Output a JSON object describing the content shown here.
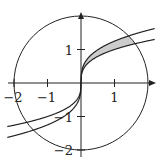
{
  "figure": {
    "colors": {
      "stroke": "#222222",
      "shade": "#cccccc",
      "background": "#ffffff"
    },
    "axes": {
      "x_ticks": [
        {
          "value": -2,
          "label": "−2"
        },
        {
          "value": -1,
          "label": "−1"
        },
        {
          "value": 1,
          "label": "1"
        }
      ],
      "y_ticks": [
        {
          "value": 1,
          "label": "1"
        },
        {
          "value": -1,
          "label": "−1"
        },
        {
          "value": -2,
          "label": "−2"
        }
      ]
    },
    "circle": {
      "center": [
        0,
        0
      ],
      "radius": 2
    },
    "curves": [
      {
        "name": "upper-curve",
        "k": 1.25
      },
      {
        "name": "lower-curve",
        "k": 1.0
      }
    ]
  }
}
